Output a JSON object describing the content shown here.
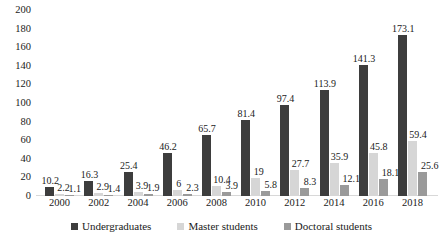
{
  "chart_data": {
    "type": "bar",
    "title": "",
    "subtitle": "",
    "xlabel": "",
    "ylabel": "",
    "ylim": [
      0,
      200
    ],
    "yticks": [
      0,
      20,
      40,
      60,
      80,
      100,
      120,
      140,
      160,
      180,
      200
    ],
    "grid": false,
    "legend_position": "bottom",
    "categories": [
      "2000",
      "2002",
      "2004",
      "2006",
      "2008",
      "2010",
      "2012",
      "2014",
      "2016",
      "2018"
    ],
    "series": [
      {
        "name": "Undergraduates",
        "color": "#3d3d3d",
        "values": [
          10.2,
          16.3,
          25.4,
          46.2,
          65.7,
          81.4,
          97.4,
          113.9,
          141.3,
          173.1
        ],
        "labels": [
          "10.2",
          "16.3",
          "25.4",
          "46.2",
          "65.7",
          "81.4",
          "97.4",
          "113.9",
          "141.3",
          "173.1"
        ]
      },
      {
        "name": "Master students",
        "color": "#d6d6d6",
        "values": [
          2.2,
          2.9,
          3.9,
          6,
          10.4,
          19,
          27.7,
          35.9,
          45.8,
          59.4
        ],
        "labels": [
          "2.2",
          "2.9",
          "3.9",
          "6",
          "10.4",
          "19",
          "27.7",
          "35.9",
          "45.8",
          "59.4"
        ]
      },
      {
        "name": "Doctoral students",
        "color": "#9a9a9a",
        "values": [
          1.1,
          1.4,
          1.9,
          2.3,
          3.9,
          5.8,
          8.3,
          12.1,
          18.1,
          25.6
        ],
        "labels": [
          "1.1",
          "1.4",
          "1.9",
          "2.3",
          "3.9",
          "5.8",
          "8.3",
          "12.1",
          "18.1",
          "25.6"
        ]
      }
    ]
  }
}
